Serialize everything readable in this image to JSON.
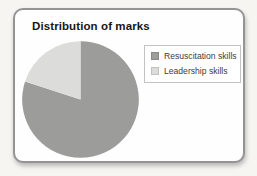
{
  "chart_data": {
    "type": "pie",
    "title": "Distribution of marks",
    "categories": [
      "Resuscitation skills",
      "Leadership skills"
    ],
    "values": [
      80,
      20
    ],
    "unit": "percent-of-circle (estimated from slice angles)",
    "colors": [
      "#9c9c9a",
      "#dcdcda"
    ],
    "start_angle": "top (12 o'clock)",
    "direction": "clockwise",
    "legend_position": "right",
    "grid": false
  },
  "legend": {
    "items": [
      {
        "label": "Resuscitation skills",
        "color": "#9c9c9a"
      },
      {
        "label": "Leadership skills",
        "color": "#dcdcda"
      }
    ]
  }
}
